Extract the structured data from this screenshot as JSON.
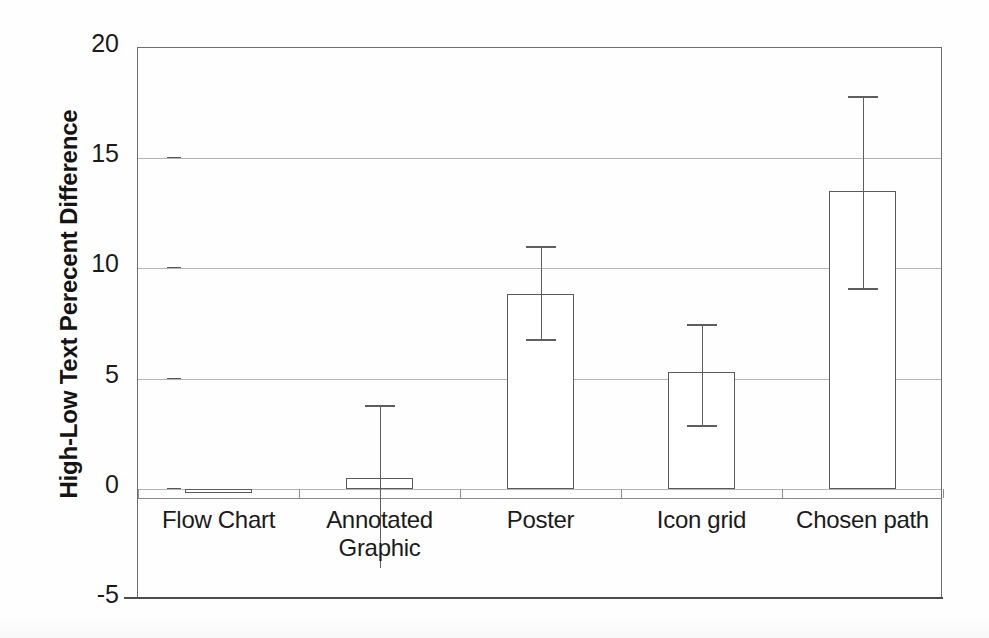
{
  "chart_data": {
    "type": "bar",
    "title": "",
    "subtitle": "",
    "xlabel": "",
    "ylabel": "High-Low Text Perecent Difference",
    "categories": [
      "Flow Chart",
      "Annotated Graphic",
      "Poster",
      "Icon grid",
      "Chosen path"
    ],
    "category_lines": [
      [
        "Flow Chart"
      ],
      [
        "Annotated",
        "Graphic"
      ],
      [
        "Poster"
      ],
      [
        "Icon grid"
      ],
      [
        "Chosen path"
      ]
    ],
    "values": [
      -0.2,
      0.5,
      8.85,
      5.3,
      13.5
    ],
    "error_upper": [
      0.0,
      3.8,
      11.0,
      7.5,
      17.8
    ],
    "error_lower": [
      0.0,
      -3.6,
      6.8,
      2.9,
      9.1
    ],
    "has_error_bars": [
      false,
      true,
      true,
      true,
      true
    ],
    "ylim": [
      -5,
      20
    ],
    "yticks": [
      20,
      15,
      10,
      5,
      0,
      -5
    ],
    "ytick_labels": [
      "20",
      "15",
      "10",
      "5",
      "0",
      "-5"
    ],
    "grid": true,
    "grid_axis": "y",
    "legend": null,
    "legend_position": "none",
    "bar_fill": "#ffffff",
    "bar_edge": "#5a5a5a",
    "error_color": "#5e5e5e",
    "grid_color": "#b4b4b4",
    "frame_color": "#6e6e6e",
    "background": "#fefefe"
  },
  "figure": {
    "name": "high-low-text-percent-difference-bar-chart"
  }
}
